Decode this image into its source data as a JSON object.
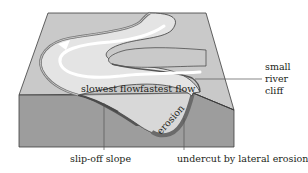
{
  "figure": {
    "labels": {
      "slowest_flow": "slowest flow",
      "fastest_flow": "fastest flow",
      "river_cliff_line1": "small",
      "river_cliff_line2": "river",
      "river_cliff_line3": "cliff",
      "erosion": "erosion",
      "slip_off_slope": "slip-off slope",
      "undercut": "undercut by lateral erosion"
    },
    "colors": {
      "top_face": "#c9c9c9",
      "front_face": "#9d9d9d",
      "river_water": "#e4e4e4",
      "flow_arrow": "#ffffff",
      "bank_dark": "#6e6e6e",
      "outline": "#3c3c3c",
      "leader_line": "#555555",
      "text": "#231f20"
    }
  }
}
